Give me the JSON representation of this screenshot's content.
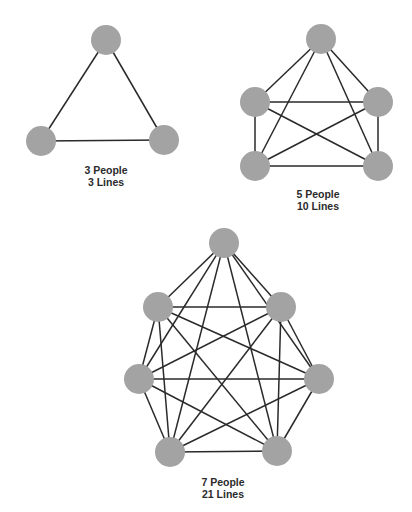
{
  "colors": {
    "node": "#a3a3a3",
    "edge": "#2a2a2a",
    "text": "#2b2b2b",
    "background": "#ffffff"
  },
  "node_radius": 15,
  "graphs": [
    {
      "id": "graph-3",
      "people_label": "3 People",
      "lines_label": "3 Lines",
      "label_pos": [
        106,
        164
      ],
      "nodes": [
        [
          106,
          40
        ],
        [
          41,
          141
        ],
        [
          164,
          140
        ]
      ]
    },
    {
      "id": "graph-5",
      "people_label": "5 People",
      "lines_label": "10 Lines",
      "label_pos": [
        318,
        188
      ],
      "nodes": [
        [
          321,
          39
        ],
        [
          255,
          102
        ],
        [
          378,
          102
        ],
        [
          255,
          166
        ],
        [
          378,
          166
        ]
      ]
    },
    {
      "id": "graph-7",
      "people_label": "7 People",
      "lines_label": "21 Lines",
      "label_pos": [
        223,
        476
      ],
      "nodes": [
        [
          224,
          243
        ],
        [
          158,
          307
        ],
        [
          281,
          307
        ],
        [
          139,
          379
        ],
        [
          319,
          379
        ],
        [
          170,
          452
        ],
        [
          277,
          451
        ]
      ]
    }
  ]
}
